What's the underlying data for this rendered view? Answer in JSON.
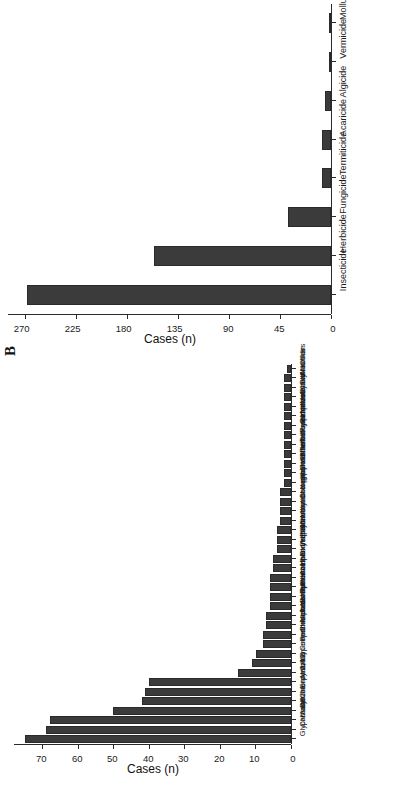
{
  "figure": {
    "panel_b_letter": "B",
    "orientation": "rotated-90-clockwise"
  },
  "chart_data": [
    {
      "id": "panel-a",
      "type": "bar",
      "title": "",
      "xlabel": "",
      "ylabel": "Cases (n)",
      "ylim": [
        0,
        285
      ],
      "yticks": [
        0,
        45,
        90,
        135,
        180,
        225,
        270
      ],
      "grid": false,
      "legend": "none",
      "categories": [
        "Insecticide",
        "Herbicide",
        "Fungicide",
        "Termiticide",
        "Acaricide",
        "Algicide",
        "Vermicide",
        "Molluscicide"
      ],
      "values": [
        268,
        156,
        38,
        8,
        8,
        5,
        1,
        1
      ]
    },
    {
      "id": "panel-b",
      "type": "bar",
      "title": "",
      "xlabel": "",
      "ylabel": "Cases (n)",
      "ylim": [
        0,
        78
      ],
      "yticks": [
        0,
        10,
        20,
        30,
        40,
        50,
        60,
        70
      ],
      "grid": false,
      "legend": "none",
      "categories": [
        "Glyphosate",
        "Carbaryl",
        "Malathion",
        "Diazinon",
        "Chlorpyrifos",
        "Endosulfan",
        "Atrazine",
        "2,4-D",
        "Cypermethrin",
        "Cooper sulphate",
        "Penoxsulam",
        "Chlorantraniliprole",
        "Metolachlor",
        "Acetochlor",
        "S-metolachlor",
        "Pymetrozine",
        "Permethrin",
        "Azinphosmethyl",
        "Haloxyfop-P-methyl",
        "Dimethoate",
        "Propanil",
        "Picloram",
        "Mancozeb",
        "Monocrotophos",
        "Imidacloprid",
        "Chlorothalonil",
        "a-cypermethrin",
        "y-cyhalothrin",
        "Triadimefon",
        "Thiamethoxam",
        "Terbuthylazine",
        "Tebupirimphos",
        "Propiconizole",
        "Pirimicarb",
        "Nicosulfuron",
        "Metalaxyl",
        "Cyfluthrin",
        "Clothianidin",
        "Alachlor",
        "Others"
      ],
      "values": [
        75,
        69,
        68,
        50,
        42,
        41,
        40,
        15,
        11,
        10,
        8,
        8,
        7,
        7,
        6,
        6,
        6,
        6,
        5,
        5,
        4,
        4,
        4,
        3,
        3,
        3,
        3,
        2,
        2,
        2,
        2,
        2,
        2,
        2,
        2,
        2,
        2,
        2,
        2,
        1
      ]
    }
  ],
  "colors": {
    "bar_fill": "#3b3b3b",
    "bar_stroke": "#2a2a2a",
    "axis": "#2b2b2b",
    "text": "#1a1a1a",
    "background": "#ffffff"
  }
}
